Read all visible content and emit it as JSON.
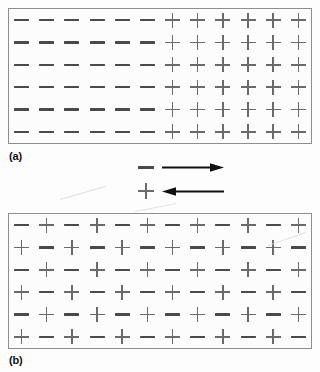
{
  "figure": {
    "background_color": "#fdfdfd",
    "border_color": "#8e8e8e",
    "minus_color": "#4a4a4a",
    "plus_color": "#6a6a6a",
    "arrow_color": "#111111"
  },
  "panels": [
    {
      "id": "a",
      "label": "(a)",
      "description": "Segregated charges: six columns of minus signs on the left, six columns of plus signs on the right",
      "rows": 6,
      "columns": 12,
      "grid": [
        [
          "minus",
          "minus",
          "minus",
          "minus",
          "minus",
          "minus",
          "plus",
          "plus",
          "plus",
          "plus",
          "plus",
          "plus"
        ],
        [
          "minus",
          "minus",
          "minus",
          "minus",
          "minus",
          "minus",
          "plus",
          "plus",
          "plus",
          "plus",
          "plus",
          "plus"
        ],
        [
          "minus",
          "minus",
          "minus",
          "minus",
          "minus",
          "minus",
          "plus",
          "plus",
          "plus",
          "plus",
          "plus",
          "plus"
        ],
        [
          "minus",
          "minus",
          "minus",
          "minus",
          "minus",
          "minus",
          "plus",
          "plus",
          "plus",
          "plus",
          "plus",
          "plus"
        ],
        [
          "minus",
          "minus",
          "minus",
          "minus",
          "minus",
          "minus",
          "plus",
          "plus",
          "plus",
          "plus",
          "plus",
          "plus"
        ],
        [
          "minus",
          "minus",
          "minus",
          "minus",
          "minus",
          "minus",
          "plus",
          "plus",
          "plus",
          "plus",
          "plus",
          "plus"
        ]
      ]
    },
    {
      "id": "b",
      "label": "(b)",
      "description": "Mixed charges: alternating checkerboard of minus and plus signs",
      "rows": 6,
      "columns": 12,
      "grid": [
        [
          "minus",
          "plus",
          "minus",
          "plus",
          "minus",
          "plus",
          "minus",
          "plus",
          "minus",
          "plus",
          "minus",
          "plus"
        ],
        [
          "plus",
          "minus",
          "plus",
          "minus",
          "plus",
          "minus",
          "plus",
          "minus",
          "plus",
          "minus",
          "plus",
          "minus"
        ],
        [
          "minus",
          "plus",
          "minus",
          "plus",
          "minus",
          "plus",
          "minus",
          "plus",
          "minus",
          "plus",
          "minus",
          "plus"
        ],
        [
          "plus",
          "minus",
          "plus",
          "minus",
          "plus",
          "minus",
          "plus",
          "minus",
          "plus",
          "minus",
          "plus",
          "minus"
        ],
        [
          "minus",
          "plus",
          "minus",
          "plus",
          "minus",
          "plus",
          "minus",
          "plus",
          "minus",
          "plus",
          "minus",
          "plus"
        ],
        [
          "plus",
          "minus",
          "plus",
          "minus",
          "plus",
          "minus",
          "plus",
          "minus",
          "plus",
          "minus",
          "plus",
          "minus"
        ]
      ]
    }
  ],
  "legend": {
    "rows": [
      {
        "symbol": "minus",
        "arrow_direction": "right",
        "meaning": "negative charges migrate to the right"
      },
      {
        "symbol": "plus",
        "arrow_direction": "left",
        "meaning": "positive charges migrate to the left"
      }
    ]
  }
}
